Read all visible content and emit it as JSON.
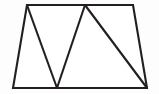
{
  "figure": {
    "canvas": {
      "width": 159,
      "height": 94,
      "background_color": "#fdfdfd"
    },
    "style": {
      "stroke_color": "#231f20",
      "fill_color": "#ffffff",
      "stroke_width": 2.1
    },
    "outline": {
      "name": "trapezoid",
      "points": "27,5 133,5 147,88 13,88",
      "vertices": [
        {
          "label": "top-left",
          "x": 27,
          "y": 5
        },
        {
          "label": "top-right",
          "x": 133,
          "y": 5
        },
        {
          "label": "bottom-right",
          "x": 147,
          "y": 88
        },
        {
          "label": "bottom-left",
          "x": 13,
          "y": 88
        }
      ]
    },
    "dividers": [
      {
        "name": "divider-top-left-to-bottom-mid",
        "x1": 27,
        "y1": 5,
        "x2": 57,
        "y2": 88
      },
      {
        "name": "divider-bottom-mid-to-top-apex",
        "x1": 57,
        "y1": 88,
        "x2": 85,
        "y2": 5
      },
      {
        "name": "divider-top-apex-to-bottom-right",
        "x1": 85,
        "y1": 5,
        "x2": 147,
        "y2": 88
      }
    ]
  }
}
